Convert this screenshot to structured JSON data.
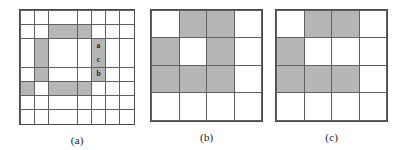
{
  "figure": {
    "background_color": "#ffffff",
    "shade_color": "#b6b6b6",
    "empty_color": "#ffffff",
    "line_color": "#606060",
    "label_color": "#1c1c1c",
    "panels": [
      {
        "id": "a",
        "caption": "(a)",
        "rows": 8,
        "cols": 8,
        "cells": [
          [
            0,
            0,
            0,
            0,
            0,
            0,
            0,
            0
          ],
          [
            0,
            0,
            1,
            1,
            1,
            0,
            0,
            0
          ],
          [
            0,
            1,
            0,
            0,
            0,
            1,
            0,
            0
          ],
          [
            0,
            1,
            0,
            0,
            0,
            1,
            0,
            0
          ],
          [
            0,
            1,
            0,
            0,
            0,
            1,
            0,
            0
          ],
          [
            1,
            0,
            1,
            1,
            1,
            0,
            0,
            0
          ],
          [
            0,
            0,
            0,
            0,
            0,
            0,
            0,
            0
          ],
          [
            0,
            0,
            0,
            0,
            0,
            0,
            0,
            0
          ]
        ],
        "cell_labels": [
          {
            "row": 2,
            "col": 5,
            "text": "a"
          },
          {
            "row": 3,
            "col": 5,
            "text": "c"
          },
          {
            "row": 4,
            "col": 5,
            "text": "b"
          }
        ]
      },
      {
        "id": "b",
        "caption": "(b)",
        "rows": 4,
        "cols": 4,
        "cells": [
          [
            0,
            1,
            1,
            0
          ],
          [
            1,
            0,
            1,
            0
          ],
          [
            1,
            1,
            1,
            0
          ],
          [
            0,
            0,
            0,
            0
          ]
        ],
        "cell_labels": []
      },
      {
        "id": "c",
        "caption": "(c)",
        "rows": 4,
        "cols": 4,
        "cells": [
          [
            0,
            1,
            1,
            0
          ],
          [
            1,
            0,
            0,
            0
          ],
          [
            1,
            1,
            1,
            0
          ],
          [
            0,
            0,
            0,
            0
          ]
        ],
        "cell_labels": []
      }
    ]
  }
}
